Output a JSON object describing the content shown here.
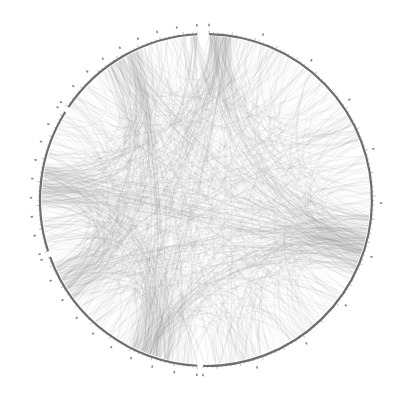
{
  "chart_data": {
    "type": "chord",
    "title": "",
    "center": [
      206,
      200
    ],
    "radius": 166,
    "colors": {
      "arc": "#6e6e6e",
      "chord": "#8a8a8a",
      "tick": "#777777",
      "background": "#ffffff"
    },
    "segments": [
      {
        "name": "segment-1",
        "start_deg": -89,
        "end_deg": 91,
        "ticks": 10
      },
      {
        "name": "segment-2",
        "start_deg": 93,
        "end_deg": 160,
        "ticks": 9
      },
      {
        "name": "segment-3",
        "start_deg": 162,
        "end_deg": 212,
        "ticks": 8
      },
      {
        "name": "segment-4",
        "start_deg": 214,
        "end_deg": 267,
        "ticks": 8
      }
    ],
    "chord_count": 900,
    "chord_opacity": 0.22,
    "hubs": [
      {
        "angle_deg": -88,
        "weight": 5
      },
      {
        "angle_deg": 12,
        "weight": 3
      },
      {
        "angle_deg": 20,
        "weight": 3
      },
      {
        "angle_deg": 110,
        "weight": 4
      },
      {
        "angle_deg": 150,
        "weight": 3
      },
      {
        "angle_deg": 185,
        "weight": 4
      },
      {
        "angle_deg": 240,
        "weight": 3
      }
    ],
    "seed": 7
  }
}
